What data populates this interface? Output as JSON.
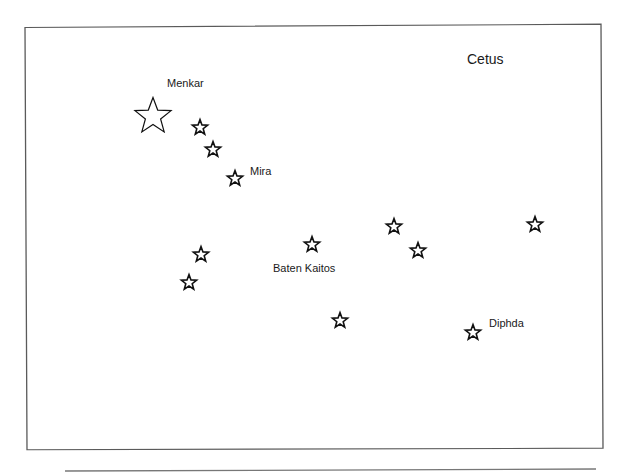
{
  "diagram": {
    "title": "Cetus",
    "type": "constellation-star-chart",
    "stars": [
      {
        "name": "Menkar",
        "label": "Menkar",
        "x": 153,
        "y": 115,
        "size": 38,
        "bright": true
      },
      {
        "name": "",
        "label": "",
        "x": 200,
        "y": 127,
        "size": 16
      },
      {
        "name": "",
        "label": "",
        "x": 213,
        "y": 149,
        "size": 16
      },
      {
        "name": "Mira",
        "label": "Mira",
        "x": 235,
        "y": 178,
        "size": 16
      },
      {
        "name": "",
        "label": "",
        "x": 201,
        "y": 254,
        "size": 16
      },
      {
        "name": "",
        "label": "",
        "x": 189,
        "y": 282,
        "size": 16
      },
      {
        "name": "Baten Kaitos",
        "label": "Baten Kaitos",
        "x": 312,
        "y": 244,
        "size": 16
      },
      {
        "name": "",
        "label": "",
        "x": 340,
        "y": 320,
        "size": 16
      },
      {
        "name": "",
        "label": "",
        "x": 394,
        "y": 226,
        "size": 16
      },
      {
        "name": "",
        "label": "",
        "x": 418,
        "y": 250,
        "size": 16
      },
      {
        "name": "",
        "label": "",
        "x": 535,
        "y": 224,
        "size": 16
      },
      {
        "name": "Diphda",
        "label": "Diphda",
        "x": 473,
        "y": 332,
        "size": 16
      }
    ]
  },
  "labels": {
    "title": "Cetus",
    "menkar": "Menkar",
    "mira": "Mira",
    "baten_kaitos": "Baten Kaitos",
    "diphda": "Diphda"
  },
  "colors": {
    "border": "#5a5a5a",
    "star_stroke": "#111111",
    "text": "#1a1a1a"
  }
}
